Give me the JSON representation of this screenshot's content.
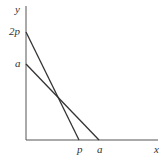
{
  "axes": {
    "x_label": "x",
    "y_label": "y",
    "x_ticks": [
      {
        "label": "p",
        "px": 79
      },
      {
        "label": "a",
        "px": 99
      }
    ],
    "y_ticks": [
      {
        "label": "2p",
        "py": 32
      },
      {
        "label": "a",
        "py": 64
      }
    ]
  },
  "lines": [
    {
      "name": "line-2p-to-p",
      "from": [
        0,
        "2p"
      ],
      "to": [
        "p",
        0
      ]
    },
    {
      "name": "line-a-to-a",
      "from": [
        0,
        "a"
      ],
      "to": [
        "a",
        0
      ]
    }
  ],
  "colors": {
    "line": "#333333",
    "axis": "#555555"
  }
}
